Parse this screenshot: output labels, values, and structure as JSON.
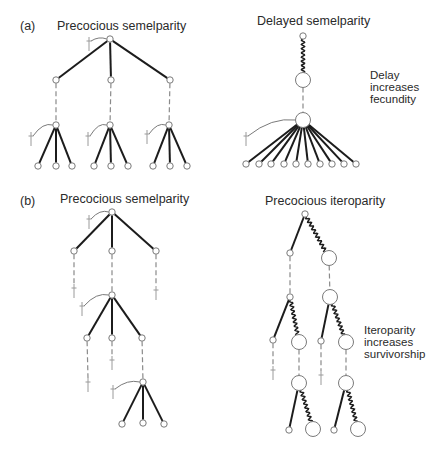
{
  "panels": {
    "a": {
      "label": "(a)",
      "left_title": "Precocious semelparity",
      "right_title": "Delayed semelparity",
      "annotation": [
        "Delay",
        "increases",
        "fecundity"
      ]
    },
    "b": {
      "label": "(b)",
      "left_title": "Precocious semelparity",
      "right_title": "Precocious iteroparity",
      "annotation": [
        "Iteroparity",
        "increases",
        "survivorship"
      ]
    }
  },
  "colors": {
    "solid_edge": "#1c1c1c",
    "wavy_edge": "#1c1c1c",
    "dashed_edge": "#8a8a8a",
    "node_stroke": "#7a7a7a",
    "node_fill": "#ffffff",
    "dagger": "#9a9a9a",
    "curve": "#7a7a7a"
  },
  "diagram": {
    "node_radius": {
      "small": 3.2,
      "big": 7.5
    },
    "nodes": [
      {
        "id": "aL0",
        "x": 110,
        "y": 39,
        "size": "small"
      },
      {
        "id": "aL1",
        "x": 56,
        "y": 80,
        "size": "small"
      },
      {
        "id": "aL2",
        "x": 111,
        "y": 80,
        "size": "small"
      },
      {
        "id": "aL3",
        "x": 170,
        "y": 80,
        "size": "small"
      },
      {
        "id": "aL4",
        "x": 56,
        "y": 125,
        "size": "small"
      },
      {
        "id": "aL5",
        "x": 110,
        "y": 125,
        "size": "small"
      },
      {
        "id": "aL6",
        "x": 169,
        "y": 125,
        "size": "small"
      },
      {
        "id": "aL7",
        "x": 38,
        "y": 166,
        "size": "small"
      },
      {
        "id": "aL8",
        "x": 56,
        "y": 166,
        "size": "small"
      },
      {
        "id": "aL9",
        "x": 72,
        "y": 166,
        "size": "small"
      },
      {
        "id": "aL10",
        "x": 94,
        "y": 166,
        "size": "small"
      },
      {
        "id": "aL11",
        "x": 111,
        "y": 166,
        "size": "small"
      },
      {
        "id": "aL12",
        "x": 128,
        "y": 166,
        "size": "small"
      },
      {
        "id": "aL13",
        "x": 153,
        "y": 166,
        "size": "small"
      },
      {
        "id": "aL14",
        "x": 170,
        "y": 166,
        "size": "small"
      },
      {
        "id": "aL15",
        "x": 187,
        "y": 166,
        "size": "small"
      },
      {
        "id": "aR0",
        "x": 303,
        "y": 36,
        "size": "small"
      },
      {
        "id": "aR1",
        "x": 303,
        "y": 80,
        "size": "big"
      },
      {
        "id": "aR2",
        "x": 303,
        "y": 120,
        "size": "big"
      },
      {
        "id": "aR3",
        "x": 246,
        "y": 164,
        "size": "small"
      },
      {
        "id": "aR4",
        "x": 259,
        "y": 164,
        "size": "small"
      },
      {
        "id": "aR5",
        "x": 271,
        "y": 164,
        "size": "small"
      },
      {
        "id": "aR6",
        "x": 284,
        "y": 164,
        "size": "small"
      },
      {
        "id": "aR7",
        "x": 296,
        "y": 164,
        "size": "small"
      },
      {
        "id": "aR8",
        "x": 308,
        "y": 164,
        "size": "small"
      },
      {
        "id": "aR9",
        "x": 320,
        "y": 164,
        "size": "small"
      },
      {
        "id": "aR10",
        "x": 332,
        "y": 164,
        "size": "small"
      },
      {
        "id": "aR11",
        "x": 344,
        "y": 164,
        "size": "small"
      },
      {
        "id": "aR12",
        "x": 356,
        "y": 164,
        "size": "small"
      },
      {
        "id": "bL0",
        "x": 112,
        "y": 212,
        "size": "small"
      },
      {
        "id": "bL1",
        "x": 74,
        "y": 251,
        "size": "small"
      },
      {
        "id": "bL2",
        "x": 112,
        "y": 251,
        "size": "small"
      },
      {
        "id": "bL3",
        "x": 156,
        "y": 251,
        "size": "small"
      },
      {
        "id": "bL4",
        "x": 112,
        "y": 295,
        "size": "small"
      },
      {
        "id": "bL5",
        "x": 87,
        "y": 338,
        "size": "small"
      },
      {
        "id": "bL6",
        "x": 112,
        "y": 338,
        "size": "small"
      },
      {
        "id": "bL7",
        "x": 142,
        "y": 338,
        "size": "small"
      },
      {
        "id": "bL8",
        "x": 143,
        "y": 382,
        "size": "small"
      },
      {
        "id": "bL9",
        "x": 122,
        "y": 424,
        "size": "small"
      },
      {
        "id": "bL10",
        "x": 143,
        "y": 423,
        "size": "small"
      },
      {
        "id": "bL11",
        "x": 164,
        "y": 424,
        "size": "small"
      },
      {
        "id": "bR0",
        "x": 305,
        "y": 214,
        "size": "small"
      },
      {
        "id": "bR1",
        "x": 290,
        "y": 253,
        "size": "small"
      },
      {
        "id": "bR2",
        "x": 329,
        "y": 258,
        "size": "big"
      },
      {
        "id": "bR3",
        "x": 290,
        "y": 297,
        "size": "small"
      },
      {
        "id": "bR4",
        "x": 330,
        "y": 297,
        "size": "big"
      },
      {
        "id": "bR5",
        "x": 273,
        "y": 340,
        "size": "small"
      },
      {
        "id": "bR6",
        "x": 299,
        "y": 342,
        "size": "big"
      },
      {
        "id": "bR7",
        "x": 321,
        "y": 341,
        "size": "small"
      },
      {
        "id": "bR8",
        "x": 346,
        "y": 342,
        "size": "big"
      },
      {
        "id": "bR9",
        "x": 299,
        "y": 383,
        "size": "big"
      },
      {
        "id": "bR10",
        "x": 346,
        "y": 383,
        "size": "big"
      },
      {
        "id": "bR11",
        "x": 289,
        "y": 430,
        "size": "small"
      },
      {
        "id": "bR12",
        "x": 313,
        "y": 429,
        "size": "big"
      },
      {
        "id": "bR13",
        "x": 334,
        "y": 430,
        "size": "small"
      },
      {
        "id": "bR14",
        "x": 358,
        "y": 429,
        "size": "big"
      }
    ],
    "daggers": [
      {
        "id": "dA0",
        "x": 89,
        "y": 37,
        "curve_to": "aL0"
      },
      {
        "id": "dA1",
        "x": 31,
        "y": 132,
        "curve_to": "aL4"
      },
      {
        "id": "dA2",
        "x": 88,
        "y": 132,
        "curve_to": "aL5"
      },
      {
        "id": "dA3",
        "x": 147,
        "y": 130,
        "curve_to": "aL6"
      },
      {
        "id": "dA4",
        "x": 246,
        "y": 132,
        "curve_to": "aR2"
      },
      {
        "id": "dB0",
        "x": 89,
        "y": 215,
        "curve_to": "bL0"
      },
      {
        "id": "dB1",
        "x": 74,
        "y": 284
      },
      {
        "id": "dB2",
        "x": 156,
        "y": 286
      },
      {
        "id": "dB3",
        "x": 82,
        "y": 302,
        "curve_to": "bL4"
      },
      {
        "id": "dB4",
        "x": 112,
        "y": 356
      },
      {
        "id": "dB5",
        "x": 88,
        "y": 378
      },
      {
        "id": "dB6",
        "x": 113,
        "y": 385,
        "curve_to": "bL8"
      },
      {
        "id": "dB7",
        "x": 273,
        "y": 366
      },
      {
        "id": "dB8",
        "x": 321,
        "y": 371
      }
    ],
    "edges": [
      {
        "from": "aL0",
        "to": "aL1",
        "style": "solid"
      },
      {
        "from": "aL0",
        "to": "aL2",
        "style": "solid"
      },
      {
        "from": "aL0",
        "to": "aL3",
        "style": "solid"
      },
      {
        "from": "aL1",
        "to": "aL4",
        "style": "dashed"
      },
      {
        "from": "aL2",
        "to": "aL5",
        "style": "dashed"
      },
      {
        "from": "aL3",
        "to": "aL6",
        "style": "dashed"
      },
      {
        "from": "aL4",
        "to": "aL7",
        "style": "solid"
      },
      {
        "from": "aL4",
        "to": "aL8",
        "style": "solid"
      },
      {
        "from": "aL4",
        "to": "aL9",
        "style": "solid"
      },
      {
        "from": "aL5",
        "to": "aL10",
        "style": "solid"
      },
      {
        "from": "aL5",
        "to": "aL11",
        "style": "solid"
      },
      {
        "from": "aL5",
        "to": "aL12",
        "style": "solid"
      },
      {
        "from": "aL6",
        "to": "aL13",
        "style": "solid"
      },
      {
        "from": "aL6",
        "to": "aL14",
        "style": "solid"
      },
      {
        "from": "aL6",
        "to": "aL15",
        "style": "solid"
      },
      {
        "from": "aR0",
        "to": "aR1",
        "style": "wavy"
      },
      {
        "from": "aR1",
        "to": "aR2",
        "style": "dashed"
      },
      {
        "from": "aR2",
        "to": "aR3",
        "style": "solid"
      },
      {
        "from": "aR2",
        "to": "aR4",
        "style": "solid"
      },
      {
        "from": "aR2",
        "to": "aR5",
        "style": "solid"
      },
      {
        "from": "aR2",
        "to": "aR6",
        "style": "solid"
      },
      {
        "from": "aR2",
        "to": "aR7",
        "style": "solid"
      },
      {
        "from": "aR2",
        "to": "aR8",
        "style": "solid"
      },
      {
        "from": "aR2",
        "to": "aR9",
        "style": "solid"
      },
      {
        "from": "aR2",
        "to": "aR10",
        "style": "solid"
      },
      {
        "from": "aR2",
        "to": "aR11",
        "style": "solid"
      },
      {
        "from": "aR2",
        "to": "aR12",
        "style": "solid"
      },
      {
        "from": "bL0",
        "to": "bL1",
        "style": "solid"
      },
      {
        "from": "bL0",
        "to": "bL2",
        "style": "solid"
      },
      {
        "from": "bL0",
        "to": "bL3",
        "style": "solid"
      },
      {
        "from": "bL1",
        "to": "dB1",
        "style": "dashed"
      },
      {
        "from": "bL3",
        "to": "dB2",
        "style": "dashed"
      },
      {
        "from": "bL2",
        "to": "bL4",
        "style": "dashed"
      },
      {
        "from": "bL4",
        "to": "bL5",
        "style": "solid"
      },
      {
        "from": "bL4",
        "to": "bL6",
        "style": "solid"
      },
      {
        "from": "bL4",
        "to": "bL7",
        "style": "solid"
      },
      {
        "from": "bL5",
        "to": "dB5",
        "style": "dashed"
      },
      {
        "from": "bL6",
        "to": "dB4",
        "style": "dashed"
      },
      {
        "from": "bL7",
        "to": "bL8",
        "style": "dashed"
      },
      {
        "from": "bL8",
        "to": "bL9",
        "style": "solid"
      },
      {
        "from": "bL8",
        "to": "bL10",
        "style": "solid"
      },
      {
        "from": "bL8",
        "to": "bL11",
        "style": "solid"
      },
      {
        "from": "bR0",
        "to": "bR1",
        "style": "solid"
      },
      {
        "from": "bR0",
        "to": "bR2",
        "style": "wavy"
      },
      {
        "from": "bR1",
        "to": "bR3",
        "style": "dashed"
      },
      {
        "from": "bR2",
        "to": "bR4",
        "style": "dashed"
      },
      {
        "from": "bR3",
        "to": "bR5",
        "style": "solid"
      },
      {
        "from": "bR3",
        "to": "bR6",
        "style": "wavy"
      },
      {
        "from": "bR4",
        "to": "bR7",
        "style": "solid"
      },
      {
        "from": "bR4",
        "to": "bR8",
        "style": "wavy"
      },
      {
        "from": "bR5",
        "to": "dB7",
        "style": "dashed"
      },
      {
        "from": "bR7",
        "to": "dB8",
        "style": "dashed"
      },
      {
        "from": "bR6",
        "to": "bR9",
        "style": "dashed"
      },
      {
        "from": "bR8",
        "to": "bR10",
        "style": "dashed"
      },
      {
        "from": "bR9",
        "to": "bR11",
        "style": "solid"
      },
      {
        "from": "bR9",
        "to": "bR12",
        "style": "wavy"
      },
      {
        "from": "bR10",
        "to": "bR13",
        "style": "solid"
      },
      {
        "from": "bR10",
        "to": "bR14",
        "style": "wavy"
      }
    ]
  }
}
